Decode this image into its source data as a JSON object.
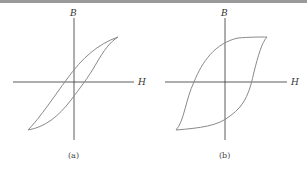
{
  "figure": {
    "panels": [
      {
        "id": "a",
        "caption": "(a)",
        "x_axis_label": "H",
        "y_axis_label": "B",
        "description": "Narrow hysteresis loop (soft magnetic material)"
      },
      {
        "id": "b",
        "caption": "(b)",
        "x_axis_label": "H",
        "y_axis_label": "B",
        "description": "Wide hysteresis loop (hard magnetic material)"
      }
    ],
    "colors": {
      "axis": "#333333",
      "curve": "#8a8a8a",
      "top_border": "#9a9a9a"
    }
  }
}
